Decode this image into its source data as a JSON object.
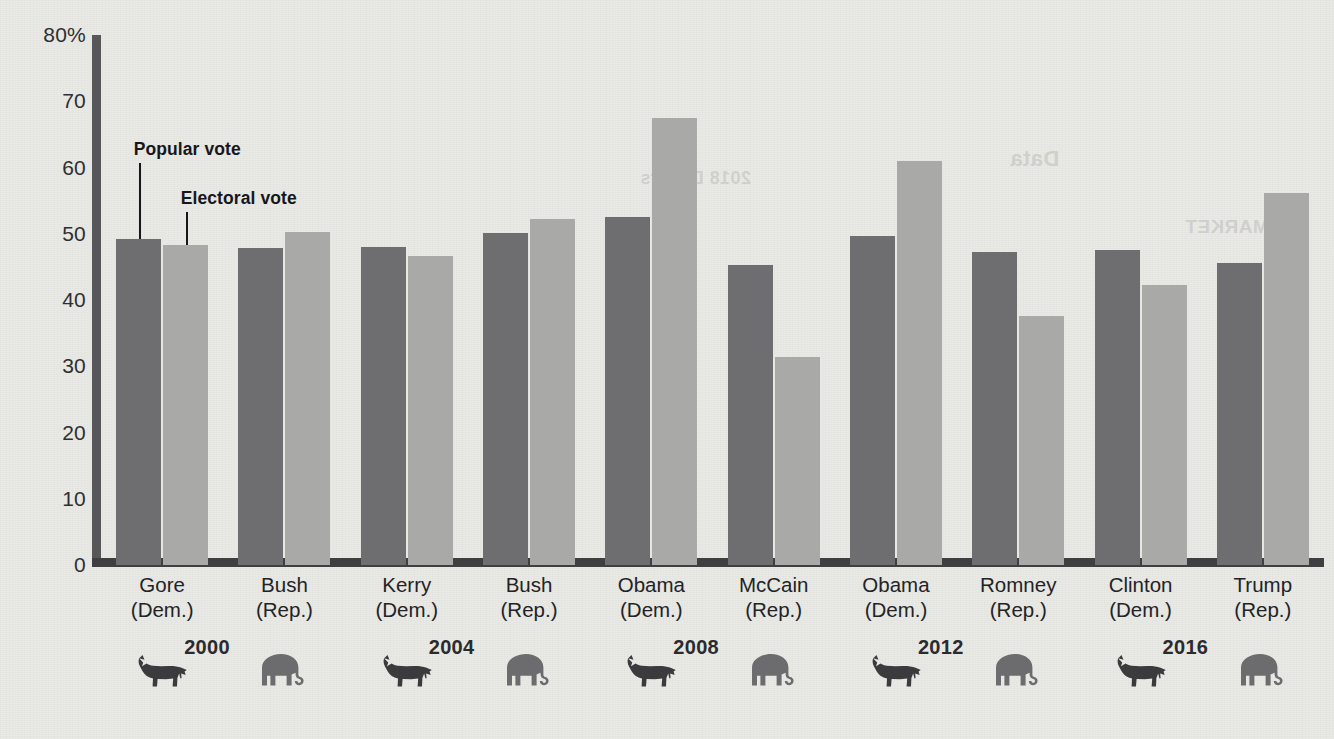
{
  "chart_data": {
    "type": "bar",
    "title": "",
    "xlabel": "",
    "ylabel": "",
    "ylim": [
      0,
      80
    ],
    "grid": false,
    "legend_position": "annotated-callouts",
    "y_ticks": [
      "80%",
      "70",
      "60",
      "50",
      "40",
      "30",
      "20",
      "10",
      "0"
    ],
    "y_tick_values": [
      80,
      70,
      60,
      50,
      40,
      30,
      20,
      10,
      0
    ],
    "categories": [
      "Gore (Dem.)",
      "Bush (Rep.)",
      "Kerry (Dem.)",
      "Bush (Rep.)",
      "Obama (Dem.)",
      "McCain (Rep.)",
      "Obama (Dem.)",
      "Romney (Rep.)",
      "Clinton (Dem.)",
      "Trump (Rep.)"
    ],
    "series": [
      {
        "name": "Popular vote",
        "color": "#6e6e70",
        "values": [
          49.2,
          47.9,
          48.0,
          50.1,
          52.6,
          45.3,
          49.6,
          47.3,
          47.5,
          45.6
        ]
      },
      {
        "name": "Electoral vote",
        "color": "#a9a9a7",
        "values": [
          48.3,
          50.2,
          46.7,
          52.3,
          67.4,
          31.4,
          61.0,
          37.6,
          42.2,
          56.1
        ]
      }
    ],
    "annotations": [
      {
        "text": "Popular vote",
        "target_series": "Popular vote",
        "target_category": "Gore (Dem.)"
      },
      {
        "text": "Electoral vote",
        "target_series": "Electoral vote",
        "target_category": "Gore (Dem.)"
      }
    ]
  },
  "axis": {
    "y_ticks": [
      {
        "label": "80%",
        "value": 80
      },
      {
        "label": "70",
        "value": 70
      },
      {
        "label": "60",
        "value": 60
      },
      {
        "label": "50",
        "value": 50
      },
      {
        "label": "40",
        "value": 40
      },
      {
        "label": "30",
        "value": 30
      },
      {
        "label": "20",
        "value": 20
      },
      {
        "label": "10",
        "value": 10
      },
      {
        "label": "0",
        "value": 0
      }
    ]
  },
  "candidates": [
    {
      "name": "Gore",
      "party": "(Dem.)",
      "party_icon": "donkey-icon",
      "year": "2000"
    },
    {
      "name": "Bush",
      "party": "(Rep.)",
      "party_icon": "elephant-icon",
      "year": ""
    },
    {
      "name": "Kerry",
      "party": "(Dem.)",
      "party_icon": "donkey-icon",
      "year": "2004"
    },
    {
      "name": "Bush",
      "party": "(Rep.)",
      "party_icon": "elephant-icon",
      "year": ""
    },
    {
      "name": "Obama",
      "party": "(Dem.)",
      "party_icon": "donkey-icon",
      "year": "2008"
    },
    {
      "name": "McCain",
      "party": "(Rep.)",
      "party_icon": "elephant-icon",
      "year": ""
    },
    {
      "name": "Obama",
      "party": "(Dem.)",
      "party_icon": "donkey-icon",
      "year": "2012"
    },
    {
      "name": "Romney",
      "party": "(Rep.)",
      "party_icon": "elephant-icon",
      "year": ""
    },
    {
      "name": "Clinton",
      "party": "(Dem.)",
      "party_icon": "donkey-icon",
      "year": "2016"
    },
    {
      "name": "Trump",
      "party": "(Rep.)",
      "party_icon": "elephant-icon",
      "year": ""
    }
  ],
  "year_labels": [
    "2000",
    "2004",
    "2008",
    "2012",
    "2016"
  ],
  "annotations": {
    "popular_vote": "Popular vote",
    "electoral_vote": "Electoral vote"
  },
  "colors": {
    "popular_vote_bar": "#6e6e70",
    "electoral_vote_bar": "#a9a9a7",
    "axis": "#3f3f42",
    "background": "#e9e9e6",
    "text": "#232325"
  },
  "bleed_through": [
    {
      "text": "2018 Dollars",
      "x": 640,
      "y": 168,
      "size": 18
    },
    {
      "text": "Data",
      "x": 1010,
      "y": 146,
      "size": 22
    },
    {
      "text": "MARKET",
      "x": 1185,
      "y": 216,
      "size": 19
    }
  ]
}
